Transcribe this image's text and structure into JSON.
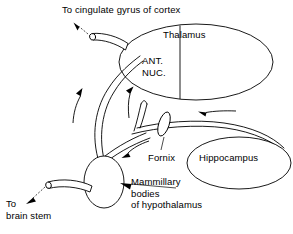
{
  "diagram": {
    "background_color": "#ffffff",
    "stroke_color": "#000000",
    "labels": {
      "to_cingulate": "To cingulate gyrus of cortex",
      "thalamus": "Thalamus",
      "ant_nuc_line1": "ANT.",
      "ant_nuc_line2": "NUC.",
      "fornix": "Fornix",
      "hippocampus": "Hippocampus",
      "mammillary_line1": "Mammillary",
      "mammillary_line2": "bodies",
      "mammillary_line3": "of hypothalamus",
      "to_brain_stem_line1": "To",
      "to_brain_stem_line2": "brain stem"
    },
    "structures": [
      {
        "name": "thalamus",
        "shape": "ellipse",
        "label": "Thalamus"
      },
      {
        "name": "anterior-nucleus",
        "shape": "ellipse-segment",
        "label": "ANT. NUC."
      },
      {
        "name": "hippocampus",
        "shape": "ellipse",
        "label": "Hippocampus"
      },
      {
        "name": "mammillary-body",
        "shape": "ellipse",
        "label": "Mammillary bodies of hypothalamus"
      },
      {
        "name": "fornix",
        "shape": "tract",
        "label": "Fornix"
      }
    ],
    "flow_arrows": [
      {
        "name": "cingulate-projection",
        "direction": "up-left",
        "style": "dashed"
      },
      {
        "name": "mammillothalamic-left",
        "direction": "up"
      },
      {
        "name": "mammillothalamic-right",
        "direction": "up"
      },
      {
        "name": "fornix-body-inflow",
        "direction": "left"
      },
      {
        "name": "fornix-to-mammillary",
        "direction": "down-left"
      },
      {
        "name": "brainstem-projection",
        "direction": "down-left",
        "style": "dashed"
      }
    ]
  }
}
